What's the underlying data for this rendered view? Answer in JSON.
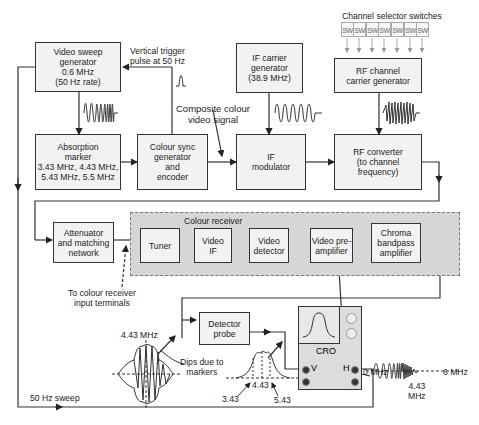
{
  "diagram": {
    "blocks": {
      "video_sweep": "Video sweep generator 0.6 MHz (50 Hz rate)",
      "video_sweep_lines": [
        "Video sweep",
        "generator",
        "0.6 MHz",
        "(50 Hz rate)"
      ],
      "absorption_lines": [
        "Absorption",
        "marker",
        "3.43 MHz, 4.43 MHz,",
        "5.43 MHz, 5.5 MHz"
      ],
      "colour_sync_lines": [
        "Colour sync",
        "generator",
        "and",
        "encoder"
      ],
      "if_carrier_lines": [
        "IF carrier",
        "generator",
        "(38.9 MHz)"
      ],
      "if_modulator_lines": [
        "IF",
        "modulator"
      ],
      "rf_channel_lines": [
        "RF channel",
        "carrier generator"
      ],
      "rf_converter_lines": [
        "RF converter",
        "(to channel",
        "frequency)"
      ],
      "attenuator_lines": [
        "Attenuator",
        "and matching",
        "network"
      ],
      "tuner": "Tuner",
      "video_if_lines": [
        "Video",
        "IF"
      ],
      "video_detector_lines": [
        "Video",
        "detector"
      ],
      "video_preamp_lines": [
        "Video pre-",
        "amplifier"
      ],
      "chroma_lines": [
        "Chroma",
        "bandpass",
        "amplifier"
      ],
      "detector_probe_lines": [
        "Detector",
        "probe"
      ],
      "cro": "CRO"
    },
    "labels": {
      "channel_selector": "Channel selector switches",
      "switch": "SW",
      "vertical_trigger_lines": [
        "Vertical trigger",
        "pulse at 50 Hz"
      ],
      "composite_lines": [
        "Composite colour",
        "video signal"
      ],
      "colour_receiver": "Colour receiver",
      "input_terminals_lines": [
        "To colour receiver",
        "input terminals"
      ],
      "freq_443": "4.43 MHz",
      "dips_lines": [
        "Dips due to",
        "markers"
      ],
      "sweep_50hz": "50 Hz sweep",
      "mark_343": "3.43",
      "mark_443": "4.43",
      "mark_543": "5.43",
      "zero_mhz": "0 MHz",
      "six_mhz": "6 MHz",
      "chroma_443_lines": [
        "4.43",
        "MHz"
      ],
      "v": "V",
      "h": "H"
    },
    "switch_count": 7
  }
}
